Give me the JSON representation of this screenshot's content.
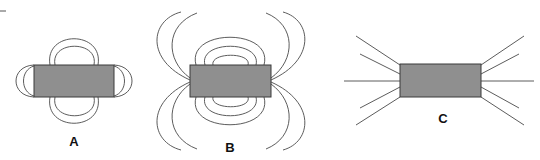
{
  "figure": {
    "colors": {
      "magnet_fill": "#8f8f8f",
      "magnet_border": "#3a3a3a",
      "field_line": "#4a4a4a",
      "background": "#ffffff"
    },
    "panels": [
      {
        "id": "A",
        "label": "A",
        "pattern": "closed loops hugging the magnet (top, bottom, and both ends)"
      },
      {
        "id": "B",
        "label": "B",
        "pattern": "closed loops over top/bottom plus open curves diverging from the ends"
      },
      {
        "id": "C",
        "label": "C",
        "pattern": "straight radial lines fanning out from each end"
      }
    ]
  }
}
